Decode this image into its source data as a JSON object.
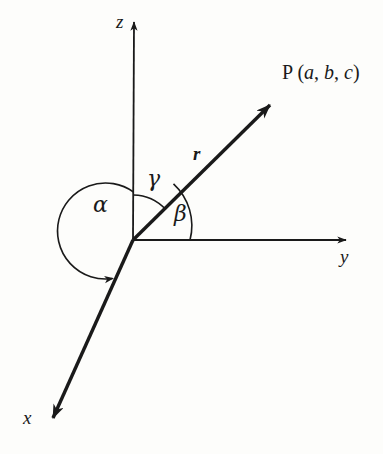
{
  "figure": {
    "background_color": "#fdfdfb",
    "stroke_color": "#1a1a1a",
    "origin": {
      "x": 133,
      "y": 240
    },
    "axes": [
      {
        "id": "z-axis",
        "label": "z",
        "direction": "up",
        "arrow_tip": {
          "x": 134,
          "y": 13
        },
        "label_pos": {
          "x": 116,
          "y": 12
        }
      },
      {
        "id": "y-axis",
        "label": "y",
        "direction": "right",
        "arrow_tip": {
          "x": 356,
          "y": 240
        },
        "label_pos": {
          "x": 340,
          "y": 247
        }
      },
      {
        "id": "x-axis",
        "label": "x",
        "direction": "down-left",
        "arrow_tip": {
          "x": 43,
          "y": 426
        },
        "label_pos": {
          "x": 23,
          "y": 408
        }
      }
    ],
    "vector": {
      "id": "position-vector",
      "label": "r",
      "label_pos": {
        "x": 193,
        "y": 144
      },
      "arrow_tip": {
        "x": 280,
        "y": 96
      },
      "endpoint_label": "P (a, b, c)",
      "endpoint_label_prefix": "P (",
      "endpoint_components": [
        "a",
        "b",
        "c"
      ],
      "endpoint_label_suffix": ")",
      "endpoint_label_pos": {
        "x": 282,
        "y": 62
      }
    },
    "angles": [
      {
        "id": "angle-alpha",
        "label": "α",
        "name": "alpha",
        "between": [
          "z-axis",
          "x-axis"
        ],
        "radius": 48,
        "has_arrowhead": true,
        "label_pos": {
          "x": 93,
          "y": 194
        }
      },
      {
        "id": "angle-beta",
        "label": "β",
        "name": "beta",
        "between": [
          "position-vector",
          "y-axis"
        ],
        "radius": 57,
        "has_arrowhead": false,
        "label_pos": {
          "x": 174,
          "y": 203
        }
      },
      {
        "id": "angle-gamma",
        "label": "γ",
        "name": "gamma",
        "between": [
          "z-axis",
          "position-vector"
        ],
        "radius": 45,
        "has_arrowhead": false,
        "label_pos": {
          "x": 147,
          "y": 168
        }
      }
    ]
  }
}
